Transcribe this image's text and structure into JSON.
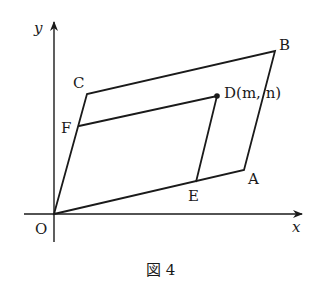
{
  "figure": {
    "caption": "図 4",
    "axes": {
      "x_label": "x",
      "y_label": "y",
      "origin_label": "O"
    },
    "points": {
      "O": {
        "label": "O",
        "px": [
          54,
          214
        ]
      },
      "A": {
        "label": "A",
        "px": [
          244,
          170
        ]
      },
      "B": {
        "label": "B",
        "px": [
          275,
          51
        ]
      },
      "C": {
        "label": "C",
        "px": [
          87,
          94
        ]
      },
      "D": {
        "label": "D(m, n)",
        "px": [
          217,
          96
        ]
      },
      "E": {
        "label": "E",
        "px": [
          196,
          182
        ]
      },
      "F": {
        "label": "F",
        "px": [
          79,
          126
        ]
      }
    },
    "segments": [
      [
        "O",
        "A"
      ],
      [
        "A",
        "B"
      ],
      [
        "B",
        "C"
      ],
      [
        "C",
        "O"
      ],
      [
        "F",
        "D"
      ],
      [
        "D",
        "E"
      ]
    ],
    "colors": {
      "ink": "#1a1a1a",
      "background": "#ffffff"
    }
  }
}
